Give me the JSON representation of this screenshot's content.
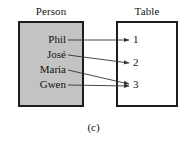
{
  "figure": {
    "caption": "(c)",
    "columns": {
      "left_header": "Person",
      "right_header": "Table"
    },
    "colors": {
      "person_box_fill": "#c3c3c3",
      "table_box_fill": "#ffffff",
      "box_border": "#1d1d1d",
      "arrow": "#333333",
      "text": "#121212",
      "background": "#ffffff"
    }
  },
  "domain": {
    "name": "Person",
    "items": [
      {
        "label": "Phil",
        "x": 66,
        "y": 40
      },
      {
        "label": "José",
        "x": 66,
        "y": 55
      },
      {
        "label": "Maria",
        "x": 66,
        "y": 70
      },
      {
        "label": "Gwen",
        "x": 66,
        "y": 85
      }
    ]
  },
  "codomain": {
    "name": "Table",
    "items": [
      {
        "label": "1",
        "x": 133,
        "y": 40
      },
      {
        "label": "2",
        "x": 133,
        "y": 63
      },
      {
        "label": "3",
        "x": 133,
        "y": 85
      }
    ]
  },
  "mappings": [
    {
      "from": "Phil",
      "to": "1",
      "x1": 68,
      "y1": 40,
      "x2": 129,
      "y2": 40
    },
    {
      "from": "José",
      "to": "2",
      "x1": 68,
      "y1": 55,
      "x2": 129,
      "y2": 63
    },
    {
      "from": "Maria",
      "to": "3",
      "x1": 68,
      "y1": 70,
      "x2": 129,
      "y2": 84
    },
    {
      "from": "Gwen",
      "to": "3",
      "x1": 68,
      "y1": 85,
      "x2": 129,
      "y2": 86
    }
  ],
  "chart_data": {
    "type": "diagram",
    "title": "(c)",
    "diagram_kind": "function-mapping-arrow-diagram",
    "sets": [
      {
        "name": "Person",
        "elements": [
          "Phil",
          "José",
          "Maria",
          "Gwen"
        ]
      },
      {
        "name": "Table",
        "elements": [
          "1",
          "2",
          "3"
        ]
      }
    ],
    "edges": [
      [
        "Phil",
        "1"
      ],
      [
        "José",
        "2"
      ],
      [
        "Maria",
        "3"
      ],
      [
        "Gwen",
        "3"
      ]
    ]
  }
}
